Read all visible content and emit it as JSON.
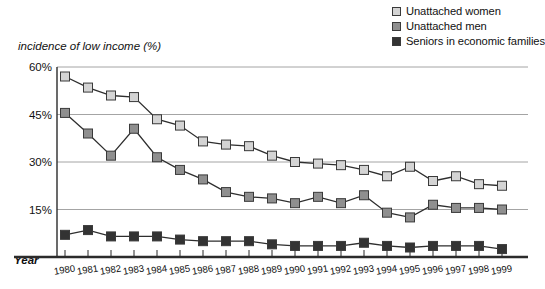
{
  "axis_title": "incidence of low income (%)",
  "year_axis_label": "Year",
  "legend": {
    "items": [
      {
        "label": "Unattached women",
        "color": "#d4d4d4",
        "marker": "square-marker"
      },
      {
        "label": "Unattached men",
        "color": "#8f8f8f",
        "marker": "square-marker"
      },
      {
        "label": "Seniors in economic families",
        "color": "#333333",
        "marker": "square-marker"
      }
    ]
  },
  "chart_data": {
    "type": "line",
    "title": "",
    "subtitle": "",
    "xlabel": "Year",
    "ylabel": "incidence of low income (%)",
    "ylim": [
      0,
      60
    ],
    "ytick_labels": [
      "60%",
      "45%",
      "30%",
      "15%"
    ],
    "ytick_values": [
      60,
      45,
      30,
      15
    ],
    "grid": true,
    "legend_position": "top-right",
    "categories": [
      "1980",
      "1981",
      "1982",
      "1983",
      "1984",
      "1985",
      "1986",
      "1987",
      "1988",
      "1989",
      "1990",
      "1991",
      "1992",
      "1993",
      "1994",
      "1995",
      "1996",
      "1997",
      "1998",
      "1999"
    ],
    "x": [
      1980,
      1981,
      1982,
      1983,
      1984,
      1985,
      1986,
      1987,
      1988,
      1989,
      1990,
      1991,
      1992,
      1993,
      1994,
      1995,
      1996,
      1997,
      1998,
      1999
    ],
    "series": [
      {
        "name": "Unattached women",
        "color": "#d4d4d4",
        "values": [
          57.0,
          53.5,
          51.0,
          50.5,
          43.5,
          41.5,
          36.5,
          35.5,
          35.0,
          32.0,
          30.0,
          29.5,
          29.0,
          27.5,
          25.5,
          28.5,
          24.0,
          25.5,
          23.0,
          22.5
        ]
      },
      {
        "name": "Unattached men",
        "color": "#8f8f8f",
        "values": [
          45.5,
          39.0,
          32.0,
          40.5,
          31.5,
          27.5,
          24.5,
          20.5,
          19.0,
          18.5,
          17.0,
          19.0,
          17.0,
          19.5,
          14.0,
          12.5,
          16.5,
          15.5,
          15.5,
          15.0
        ]
      },
      {
        "name": "Seniors in economic families",
        "color": "#333333",
        "values": [
          7.0,
          8.5,
          6.5,
          6.5,
          6.5,
          5.5,
          5.0,
          5.0,
          5.0,
          4.0,
          3.5,
          3.5,
          3.5,
          4.5,
          3.5,
          3.0,
          3.5,
          3.5,
          3.5,
          2.5
        ]
      }
    ]
  }
}
